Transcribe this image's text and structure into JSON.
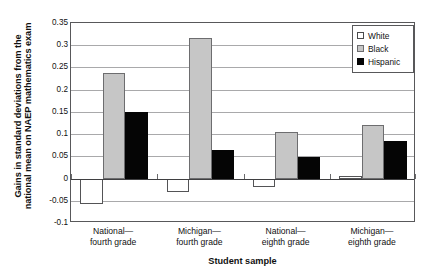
{
  "chart_data": {
    "type": "bar",
    "title": "",
    "xlabel": "Student sample",
    "ylabel_line1": "Gains in standard deviations from the",
    "ylabel_line2": "national mean on NAEP mathematics exam",
    "categories": [
      "National—fourth grade",
      "Michigan—fourth grade",
      "National—eighth grade",
      "Michigan—eighth grade"
    ],
    "categories_lines": [
      [
        "National—",
        "fourth grade"
      ],
      [
        "Michigan—",
        "fourth grade"
      ],
      [
        "National—",
        "eighth grade"
      ],
      [
        "Michigan—",
        "eighth grade"
      ]
    ],
    "series": [
      {
        "name": "White",
        "color": "#ffffff",
        "values": [
          -0.058,
          -0.03,
          -0.018,
          0.006
        ]
      },
      {
        "name": "Black",
        "color": "#c6c6c6",
        "values": [
          0.237,
          0.317,
          0.105,
          0.121
        ]
      },
      {
        "name": "Hispanic",
        "color": "#050505",
        "values": [
          0.15,
          0.065,
          0.048,
          0.085
        ]
      }
    ],
    "ylim": [
      -0.1,
      0.35
    ],
    "yticks": [
      0.35,
      0.3,
      0.25,
      0.2,
      0.15,
      0.1,
      0.05,
      0,
      -0.05,
      -0.1
    ],
    "ytick_labels": [
      "0.35",
      "0.3",
      "0.25",
      "0.2",
      "0.15",
      "0.1",
      "0.05",
      "0",
      "-0.05",
      "-0.1"
    ],
    "grid": true,
    "legend_position": "top-right",
    "legend_entries": [
      "White",
      "Black",
      "Hispanic"
    ]
  }
}
